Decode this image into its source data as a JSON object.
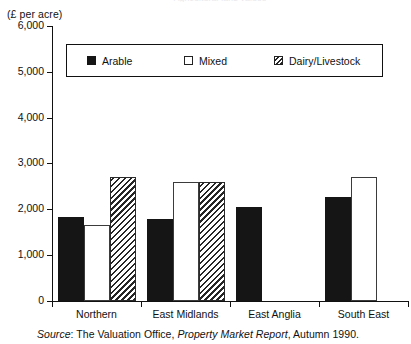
{
  "figure": {
    "clipped_title": "Agricultural land values",
    "axis_unit_label": "(£ per acre)",
    "source_note": {
      "lead_italic": "Source",
      "after_lead": ": The Valuation Office, ",
      "publication_italic": "Property Market Report",
      "tail": ", Autumn 1990."
    }
  },
  "legend": {
    "items": [
      {
        "label": "Arable",
        "swatch": "solid-black-swatch"
      },
      {
        "label": "Mixed",
        "swatch": "open-white-swatch"
      },
      {
        "label": "Dairy/Livestock",
        "swatch": "diagonal-hatch-swatch"
      }
    ]
  },
  "chart_data": {
    "type": "bar",
    "title": "Agricultural land values",
    "xlabel": "",
    "ylabel": "(£ per acre)",
    "ylim": [
      0,
      6000
    ],
    "ytick_labels": [
      "0",
      "1,000",
      "2,000",
      "3,000",
      "4,000",
      "5,000",
      "6,000"
    ],
    "ytick_values": [
      0,
      1000,
      2000,
      3000,
      4000,
      5000,
      6000
    ],
    "grid": false,
    "legend_position": "top-inside",
    "categories": [
      "Northern",
      "East Midlands",
      "East Anglia",
      "South East"
    ],
    "series": [
      {
        "name": "Arable",
        "values": [
          1830,
          1790,
          2050,
          2270
        ]
      },
      {
        "name": "Mixed",
        "values": [
          1650,
          2600,
          null,
          2700
        ]
      },
      {
        "name": "Dairy/Livestock",
        "values": [
          2700,
          2600,
          null,
          null
        ]
      }
    ]
  }
}
